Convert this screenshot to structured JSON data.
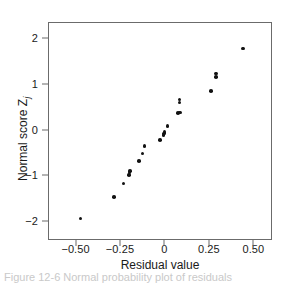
{
  "chart_data": {
    "type": "scatter",
    "title": "",
    "xlabel": "Residual value",
    "ylabel": "Normal score Z",
    "ylabel_subscript": "j",
    "xlim": [
      -0.655,
      0.605
    ],
    "ylim": [
      -2.42,
      2.36
    ],
    "grid": false,
    "legend": null,
    "xticks": [
      -0.5,
      -0.25,
      0,
      0.25,
      0.5
    ],
    "xtick_labels": [
      "−0.50",
      "−0.25",
      "0",
      "0.25",
      "0.50"
    ],
    "yticks": [
      2,
      1,
      0,
      -1,
      -2
    ],
    "ytick_labels": [
      "2",
      "1",
      "0",
      "−1",
      "−2"
    ],
    "marker": "filled-circle",
    "marker_color": "#121212",
    "points": [
      {
        "x": -0.478,
        "y": -1.93
      },
      {
        "x": -0.288,
        "y": -1.46
      },
      {
        "x": -0.235,
        "y": -1.16
      },
      {
        "x": -0.205,
        "y": -0.97
      },
      {
        "x": -0.203,
        "y": -0.92
      },
      {
        "x": -0.2,
        "y": -0.88
      },
      {
        "x": -0.148,
        "y": -0.66
      },
      {
        "x": -0.128,
        "y": -0.5
      },
      {
        "x": -0.118,
        "y": -0.34
      },
      {
        "x": -0.032,
        "y": -0.21
      },
      {
        "x": -0.012,
        "y": -0.1
      },
      {
        "x": -0.008,
        "y": -0.06
      },
      {
        "x": -0.005,
        "y": -0.03
      },
      {
        "x": 0.012,
        "y": 0.1
      },
      {
        "x": 0.072,
        "y": 0.39
      },
      {
        "x": 0.082,
        "y": 0.4
      },
      {
        "x": 0.078,
        "y": 0.62
      },
      {
        "x": 0.08,
        "y": 0.68
      },
      {
        "x": 0.255,
        "y": 0.87
      },
      {
        "x": 0.283,
        "y": 1.18
      },
      {
        "x": 0.285,
        "y": 1.25
      },
      {
        "x": 0.435,
        "y": 1.8
      }
    ]
  },
  "axes": {
    "frame_color": "#6b6b6b"
  },
  "caption": {
    "text": "Figure  12-6  Normal probability plot of residuals"
  }
}
